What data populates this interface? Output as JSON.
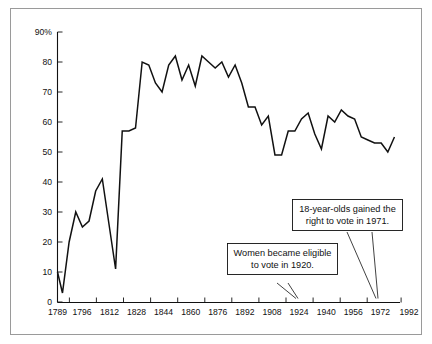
{
  "chart_data": {
    "type": "line",
    "title": "",
    "subtitle": "",
    "xlabel": "",
    "ylabel": "",
    "grid": false,
    "legend": "none",
    "xlim": [
      1789,
      1996
    ],
    "ylim": [
      0,
      90
    ],
    "y_ticks": [
      0,
      10,
      20,
      30,
      40,
      50,
      60,
      70,
      80,
      90
    ],
    "y_tick_labels": [
      "0",
      "10",
      "20",
      "30",
      "40",
      "50",
      "60",
      "70",
      "80",
      "90%"
    ],
    "x_ticks": [
      1789,
      1796,
      1812,
      1828,
      1844,
      1860,
      1876,
      1892,
      1908,
      1924,
      1940,
      1956,
      1972,
      1992
    ],
    "x_tick_labels": [
      "1789",
      "1796",
      "1812",
      "1828",
      "1844",
      "1860",
      "1876",
      "1892",
      "1908",
      "1924",
      "1940",
      "1956",
      "1972",
      "1992"
    ],
    "series": [
      {
        "name": "Voter turnout",
        "color": "#111111",
        "x": [
          1789,
          1792,
          1796,
          1800,
          1804,
          1808,
          1812,
          1816,
          1820,
          1824,
          1828,
          1832,
          1836,
          1840,
          1844,
          1848,
          1852,
          1856,
          1860,
          1864,
          1868,
          1872,
          1876,
          1880,
          1884,
          1888,
          1892,
          1896,
          1900,
          1904,
          1908,
          1912,
          1916,
          1920,
          1924,
          1928,
          1932,
          1936,
          1940,
          1944,
          1948,
          1952,
          1956,
          1960,
          1964,
          1968,
          1972,
          1976,
          1980,
          1984,
          1988,
          1992
        ],
        "values": [
          10,
          3,
          20,
          30,
          25,
          27,
          37,
          41,
          26,
          11,
          57,
          57,
          58,
          80,
          79,
          73,
          70,
          79,
          82,
          74,
          79,
          72,
          82,
          80,
          78,
          80,
          75,
          79,
          73,
          65,
          65,
          59,
          62,
          49,
          49,
          57,
          57,
          61,
          63,
          56,
          51,
          62,
          60,
          64,
          62,
          61,
          55,
          54,
          53,
          53,
          50,
          55
        ]
      }
    ],
    "annotations": [
      {
        "id": "women-suffrage",
        "lines": [
          "Women became eligible",
          "to vote in 1920."
        ],
        "points_to_year": 1920
      },
      {
        "id": "eighteen-year-olds",
        "lines": [
          "18-year-olds gained the",
          "right to vote in 1971."
        ],
        "points_to_year": 1971
      }
    ]
  }
}
